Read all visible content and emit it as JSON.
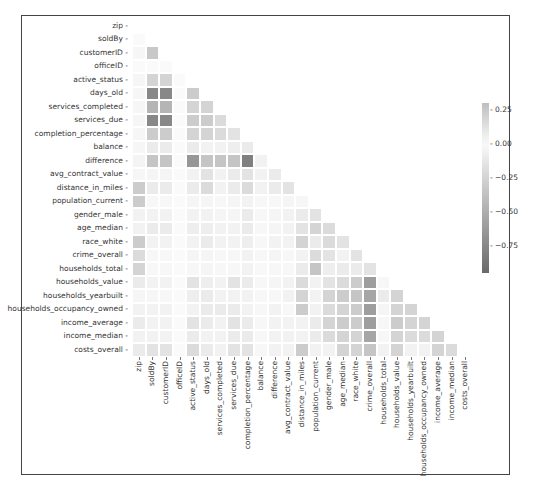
{
  "chart_data": {
    "type": "heatmap",
    "title": "",
    "subtitle": "Lower-triangle correlation matrix",
    "labels": [
      "zip",
      "soldBy",
      "customerID",
      "officeID",
      "active_status",
      "days_old",
      "services_completed",
      "services_due",
      "completion_percentage",
      "balance",
      "difference",
      "avg_contract_value",
      "distance_in_miles",
      "population_current",
      "gender_male",
      "age_median",
      "race_white",
      "crime_overall",
      "households_total",
      "households_value",
      "households_yearbuilt",
      "households_occupancy_owned",
      "income_average",
      "income_median",
      "costs_overall"
    ],
    "colorbar": {
      "ticks": [
        0.25,
        0.0,
        -0.25,
        -0.5,
        -0.75
      ],
      "tick_labels": [
        "0.25",
        "0.00",
        "−0.25",
        "−0.50",
        "−0.75"
      ],
      "vmin": -0.95,
      "vmax": 0.3,
      "position": "right"
    },
    "mask": "upper triangle and diagonal hidden",
    "matrix": [
      [],
      [
        0.0
      ],
      [
        0.02,
        0.25
      ],
      [
        0,
        0,
        0
      ],
      [
        0.02,
        -0.25,
        -0.25,
        0
      ],
      [
        0.02,
        -0.75,
        -0.75,
        0,
        -0.3
      ],
      [
        0.02,
        -0.45,
        -0.45,
        0,
        -0.25,
        -0.25
      ],
      [
        0.02,
        -0.75,
        -0.75,
        0,
        -0.3,
        -0.3,
        -0.2
      ],
      [
        0.02,
        -0.3,
        -0.3,
        0,
        -0.25,
        -0.25,
        -0.2,
        -0.15
      ],
      [
        0.02,
        -0.1,
        -0.1,
        0,
        -0.1,
        -0.05,
        -0.05,
        -0.08,
        -0.1
      ],
      [
        0.03,
        -0.35,
        -0.35,
        0,
        -0.65,
        -0.35,
        -0.35,
        -0.35,
        -0.8,
        -0.05
      ],
      [
        0.02,
        -0.03,
        -0.03,
        0,
        -0.05,
        -0.15,
        -0.05,
        -0.1,
        -0.15,
        -0.05,
        -0.1,
        -0.05
      ],
      [
        -0.3,
        -0.1,
        -0.1,
        0,
        -0.1,
        -0.2,
        -0.05,
        -0.1,
        -0.2,
        -0.05,
        -0.1,
        -0.15,
        -0.05
      ],
      [
        -0.3,
        -0.02,
        -0.02,
        0,
        -0.03,
        -0.03,
        -0.02,
        -0.03,
        -0.05,
        -0.02,
        -0.02,
        -0.03,
        0.02,
        -0.02
      ],
      [
        -0.05,
        -0.05,
        -0.05,
        0,
        -0.05,
        -0.05,
        -0.03,
        -0.03,
        -0.1,
        -0.02,
        -0.03,
        -0.05,
        -0.1,
        -0.15,
        -0.1
      ],
      [
        -0.05,
        -0.1,
        -0.1,
        0,
        -0.08,
        -0.08,
        -0.05,
        -0.05,
        -0.1,
        -0.02,
        -0.03,
        -0.05,
        -0.15,
        -0.25,
        -0.2,
        -0.2
      ],
      [
        -0.3,
        -0.05,
        -0.05,
        0,
        -0.05,
        -0.1,
        -0.05,
        -0.05,
        -0.08,
        -0.02,
        -0.05,
        -0.05,
        -0.25,
        -0.1,
        -0.2,
        -0.15,
        -0.3
      ],
      [
        -0.2,
        -0.02,
        -0.02,
        0,
        -0.03,
        -0.03,
        -0.02,
        -0.02,
        -0.05,
        -0.02,
        -0.03,
        -0.02,
        -0.05,
        -0.2,
        -0.15,
        -0.05,
        -0.15,
        -0.35
      ],
      [
        -0.25,
        -0.02,
        -0.02,
        0,
        -0.02,
        -0.03,
        -0.02,
        -0.02,
        -0.05,
        -0.01,
        -0.02,
        -0.02,
        -0.1,
        -0.35,
        -0.08,
        -0.1,
        -0.1,
        -0.15,
        -0.1
      ],
      [
        -0.1,
        -0.05,
        -0.05,
        0,
        -0.15,
        -0.08,
        -0.05,
        -0.15,
        -0.1,
        -0.02,
        -0.03,
        -0.05,
        -0.2,
        -0.05,
        -0.15,
        -0.2,
        -0.3,
        -0.6,
        -0.02,
        -0.2
      ],
      [
        0.02,
        0.02,
        -0.02,
        0,
        -0.08,
        -0.1,
        -0.05,
        -0.05,
        -0.05,
        -0.02,
        -0.02,
        -0.05,
        -0.25,
        -0.05,
        -0.25,
        -0.3,
        -0.35,
        -0.55,
        -0.1,
        -0.25,
        -0.2
      ],
      [
        -0.05,
        -0.05,
        -0.05,
        0,
        -0.05,
        -0.1,
        -0.1,
        -0.1,
        -0.05,
        -0.02,
        -0.05,
        -0.02,
        -0.3,
        -0.05,
        -0.2,
        -0.25,
        -0.3,
        -0.6,
        -0.03,
        -0.25,
        -0.25,
        -0.2
      ],
      [
        -0.1,
        -0.05,
        -0.05,
        0,
        -0.15,
        -0.1,
        -0.05,
        -0.15,
        -0.1,
        -0.02,
        -0.05,
        -0.05,
        -0.05,
        -0.1,
        -0.25,
        -0.3,
        -0.3,
        -0.6,
        -0.02,
        -0.3,
        -0.25,
        -0.25,
        -0.25
      ],
      [
        -0.05,
        -0.05,
        -0.05,
        0,
        -0.1,
        -0.05,
        -0.05,
        -0.1,
        -0.1,
        -0.02,
        -0.05,
        -0.05,
        -0.05,
        -0.1,
        -0.2,
        -0.25,
        -0.25,
        -0.55,
        -0.02,
        -0.25,
        -0.2,
        -0.2,
        -0.25,
        -0.15
      ],
      [
        -0.1,
        -0.15,
        -0.15,
        0,
        -0.2,
        -0.1,
        -0.05,
        -0.15,
        -0.15,
        -0.02,
        -0.05,
        -0.05,
        -0.3,
        -0.05,
        -0.05,
        -0.25,
        -0.25,
        -0.35,
        -0.05,
        -0.25,
        -0.05,
        -0.05,
        -0.25,
        -0.2,
        -0.05
      ]
    ],
    "xlabel": "",
    "ylabel": "",
    "grid": false
  },
  "layout_note": "seaborn-style masked correlation heatmap"
}
